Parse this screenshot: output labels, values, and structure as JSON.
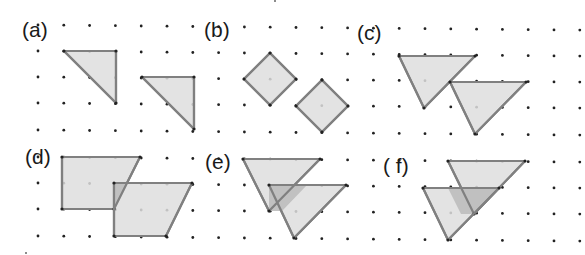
{
  "figure": {
    "panels": [
      {
        "id": "a",
        "label": "(a)",
        "label_pos": [
          22,
          19
        ]
      },
      {
        "id": "b",
        "label": "(b)",
        "label_pos": [
          204,
          19
        ]
      },
      {
        "id": "c",
        "label": "(c)",
        "label_pos": [
          357,
          22
        ]
      },
      {
        "id": "d",
        "label": "(d)",
        "label_pos": [
          25,
          146
        ]
      },
      {
        "id": "e",
        "label": "(e)",
        "label_pos": [
          205,
          151
        ]
      },
      {
        "id": "f",
        "label": "( f)",
        "label_pos": [
          383,
          155
        ]
      }
    ],
    "grid": {
      "x0": 38,
      "dx": 25.8,
      "cols": 22,
      "rows_y": [
        25,
        51,
        77,
        103,
        130,
        157,
        183,
        209,
        236
      ],
      "tilt_per_px": 0.0095,
      "dot_radius": 1.4,
      "dot_color": "#222222"
    },
    "style": {
      "fill": "#dedede",
      "overlap_fill": "#bdbdbd",
      "stroke": "#808080",
      "stroke_width": 2.2
    },
    "shapes": [
      {
        "panel": "a",
        "name": "triangle-1",
        "points": [
          [
            64,
            51
          ],
          [
            116,
            51
          ],
          [
            116,
            103
          ]
        ]
      },
      {
        "panel": "a",
        "name": "triangle-2",
        "points": [
          [
            142,
            77
          ],
          [
            194,
            77
          ],
          [
            194,
            129
          ]
        ]
      },
      {
        "panel": "b",
        "name": "square-1",
        "points": [
          [
            270,
            53
          ],
          [
            296,
            79
          ],
          [
            270,
            105
          ],
          [
            244,
            79
          ]
        ]
      },
      {
        "panel": "b",
        "name": "square-2",
        "points": [
          [
            322,
            80
          ],
          [
            348,
            106
          ],
          [
            322,
            132
          ],
          [
            296,
            106
          ]
        ]
      },
      {
        "panel": "c",
        "name": "triangle-1",
        "points": [
          [
            399,
            56
          ],
          [
            475,
            56
          ],
          [
            424,
            108
          ]
        ]
      },
      {
        "panel": "c",
        "name": "triangle-2",
        "points": [
          [
            450,
            82
          ],
          [
            526,
            82
          ],
          [
            475,
            134
          ]
        ]
      },
      {
        "panel": "d",
        "name": "trapezoid-1",
        "points": [
          [
            62,
            157
          ],
          [
            140,
            157
          ],
          [
            114,
            209
          ],
          [
            62,
            209
          ]
        ]
      },
      {
        "panel": "d",
        "name": "trapezoid-2",
        "points": [
          [
            114,
            183
          ],
          [
            192,
            183
          ],
          [
            166,
            236
          ],
          [
            114,
            236
          ]
        ]
      },
      {
        "panel": "e",
        "name": "triangle-1",
        "points": [
          [
            243,
            159
          ],
          [
            320,
            159
          ],
          [
            269,
            211
          ]
        ]
      },
      {
        "panel": "e",
        "name": "triangle-2",
        "points": [
          [
            269,
            185
          ],
          [
            346,
            185
          ],
          [
            294,
            238
          ]
        ]
      },
      {
        "panel": "f",
        "name": "triangle-1",
        "points": [
          [
            448,
            161
          ],
          [
            525,
            161
          ],
          [
            474,
            214
          ]
        ]
      },
      {
        "panel": "f",
        "name": "triangle-2",
        "points": [
          [
            423,
            188
          ],
          [
            499,
            188
          ],
          [
            448,
            240
          ]
        ]
      }
    ],
    "overlaps": [
      {
        "panel": "d",
        "points": [
          [
            114,
            183
          ],
          [
            127,
            183
          ],
          [
            114,
            209
          ]
        ]
      },
      {
        "panel": "e",
        "points": [
          [
            269,
            185
          ],
          [
            307,
            185
          ],
          [
            282,
            211
          ],
          [
            269,
            211
          ]
        ]
      },
      {
        "panel": "f",
        "points": [
          [
            448,
            188
          ],
          [
            499,
            188
          ],
          [
            474,
            214
          ],
          [
            461,
            214
          ]
        ]
      }
    ],
    "stray_marks": [
      [
        26,
        253
      ],
      [
        275,
        1
      ]
    ]
  }
}
